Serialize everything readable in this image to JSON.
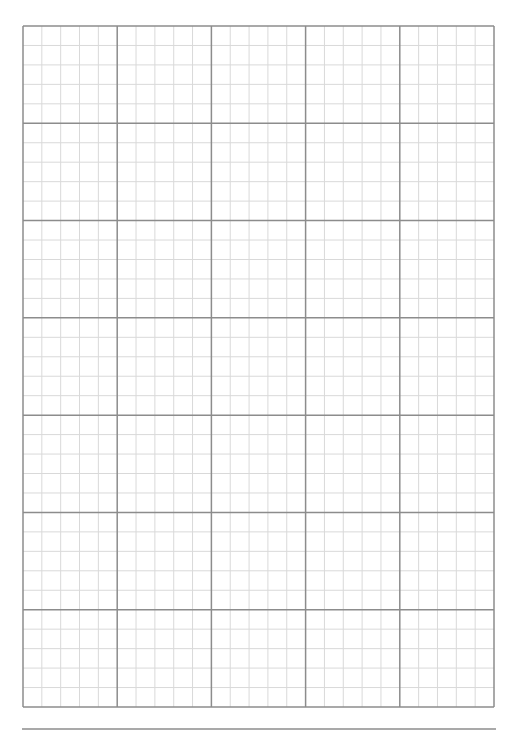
{
  "page": {
    "type": "graph-paper",
    "width": 518,
    "height": 734,
    "background": "#ffffff"
  },
  "grid": {
    "left": 23,
    "top": 26,
    "right": 494,
    "bottom": 707,
    "major_columns": 5,
    "major_rows": 7,
    "minor_per_major": 5,
    "major_color": "#8c8c8c",
    "minor_color": "#d9d9d9",
    "major_width": 1.5,
    "minor_width": 1
  },
  "footer_rule": {
    "x1": 22,
    "x2": 496,
    "y": 729,
    "color": "#8c8c8c",
    "width": 1.5
  }
}
